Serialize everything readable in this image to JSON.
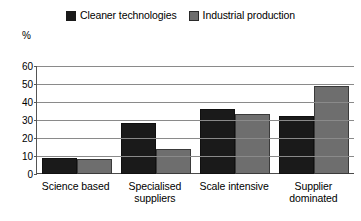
{
  "chart_data": {
    "type": "bar",
    "title": "",
    "subtitle": "",
    "xlabel": "",
    "ylabel": "%",
    "ylim": [
      0,
      60
    ],
    "yticks": [
      0,
      10,
      20,
      30,
      40,
      50,
      60
    ],
    "grid": true,
    "legend_position": "top-center",
    "categories": [
      "Science based",
      "Specialised suppliers",
      "Scale intensive",
      "Supplier dominated"
    ],
    "series": [
      {
        "name": "Cleaner technologies",
        "color": "#1a1a1a",
        "values": [
          8,
          27,
          35,
          31
        ]
      },
      {
        "name": "Industrial production",
        "color": "#6e6e6e",
        "values": [
          7,
          13,
          32,
          48
        ]
      }
    ]
  },
  "legend": {
    "entries": [
      {
        "label": "Cleaner technologies",
        "swatch": "series-0-swatch"
      },
      {
        "label": "Industrial production",
        "swatch": "series-1-swatch"
      }
    ]
  },
  "axis": {
    "unit_label": "%",
    "ytick_labels": [
      "60",
      "50",
      "40",
      "30",
      "20",
      "10",
      "0"
    ]
  },
  "xaxis": {
    "labels": [
      {
        "line1": "Science based",
        "line2": ""
      },
      {
        "line1": "Specialised",
        "line2": "suppliers"
      },
      {
        "line1": "Scale intensive",
        "line2": ""
      },
      {
        "line1": "Supplier",
        "line2": "dominated"
      }
    ]
  }
}
